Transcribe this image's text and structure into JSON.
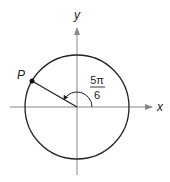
{
  "diagram": {
    "type": "unit-circle-angle",
    "axes": {
      "x_label": "x",
      "y_label": "y"
    },
    "point": {
      "label": "P",
      "angle_radians": "5π/6",
      "angle_degrees": 150
    },
    "angle_label": {
      "numerator": "5π",
      "denominator": "6"
    },
    "colors": {
      "stroke": "#222222",
      "axis": "#888888"
    }
  }
}
